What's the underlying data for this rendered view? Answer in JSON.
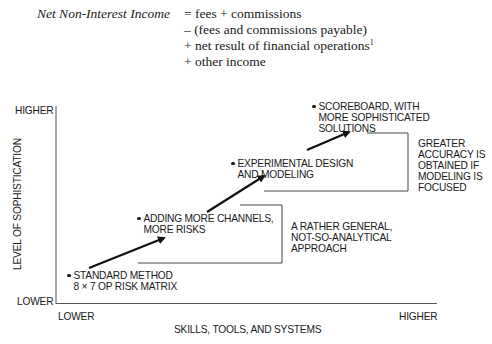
{
  "formula": {
    "lhs": "Net Non-Interest Income",
    "lines": [
      {
        "op": "=",
        "text": "fees + commissions"
      },
      {
        "op": "–",
        "text": "(fees and commissions payable)"
      },
      {
        "op": "+",
        "text": "net result of financial operations",
        "footnote": "1"
      },
      {
        "op": "+",
        "text": "other income"
      }
    ]
  },
  "diagram": {
    "y_axis": {
      "title": "LEVEL OF SOPHISTICATION",
      "high": "HIGHER",
      "low": "LOWER"
    },
    "x_axis": {
      "title": "SKILLS, TOOLS, AND SYSTEMS",
      "low": "LOWER",
      "high": "HIGHER"
    },
    "nodes": [
      {
        "line1": "STANDARD METHOD",
        "line2": "8 × 7 OP RISK MATRIX"
      },
      {
        "line1": "ADDING MORE CHANNELS,",
        "line2": "MORE RISKS"
      },
      {
        "line1": "EXPERIMENTAL DESIGN",
        "line2": "AND MODELING"
      },
      {
        "line1": "SCOREBOARD, WITH",
        "line2": "MORE SOPHISTICATED",
        "line3": "SOLUTIONS"
      }
    ],
    "annotations": [
      {
        "lines": [
          "A RATHER GENERAL,",
          "NOT-SO-ANALYTICAL",
          "APPROACH"
        ]
      },
      {
        "lines": [
          "GREATER",
          "ACCURACY IS",
          "OBTAINED IF",
          "MODELING IS",
          "FOCUSED"
        ]
      }
    ]
  }
}
